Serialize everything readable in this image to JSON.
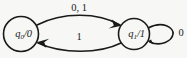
{
  "diagram": {
    "type": "state-transition-diagram",
    "background_color": "#f7f7f5",
    "stroke_color": "#1a1a1a",
    "states": [
      {
        "id": "q0",
        "label": "q0/0",
        "state_name": "q",
        "state_index": "0",
        "separator": "/",
        "output": "0",
        "cx": 21,
        "cy": 34,
        "r": 18
      },
      {
        "id": "q1",
        "label": "q1/1",
        "state_name": "q",
        "state_index": "1",
        "separator": "/",
        "output": "1",
        "cx": 134,
        "cy": 34,
        "r": 16
      }
    ],
    "transitions": [
      {
        "id": "t-q0-q1",
        "from": "q0",
        "to": "q1",
        "label": "0, 1",
        "position": "top"
      },
      {
        "id": "t-q1-q0",
        "from": "q1",
        "to": "q0",
        "label": "1",
        "position": "bottom"
      },
      {
        "id": "t-q1-q1",
        "from": "q1",
        "to": "q1",
        "label": "0",
        "position": "self-loop-right"
      }
    ]
  }
}
